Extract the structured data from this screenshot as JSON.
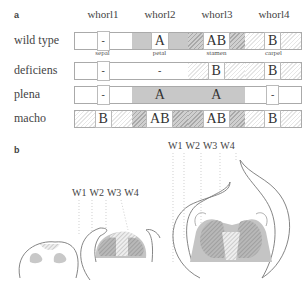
{
  "panel_a": {
    "label": "a",
    "whorls": [
      "whorl1",
      "whorl2",
      "whorl3",
      "whorl4"
    ],
    "organs": [
      "sepal",
      "petal",
      "stamen",
      "carpel"
    ],
    "rows": [
      {
        "name": "wild type",
        "cells": [
          {
            "value": "-",
            "shade": "none"
          },
          {
            "value": "A",
            "shade": "A"
          },
          {
            "value": "AB",
            "shade": "AB"
          },
          {
            "value": "B",
            "shade": "B"
          }
        ]
      },
      {
        "name": "deficiens",
        "cells": [
          {
            "value": "-",
            "shade": "none"
          },
          {
            "value": "-",
            "shade": "none"
          },
          {
            "value": "B",
            "shade": "B"
          },
          {
            "value": "B",
            "shade": "B"
          }
        ]
      },
      {
        "name": "plena",
        "cells": [
          {
            "value": "-",
            "shade": "none"
          },
          {
            "value": "A",
            "shade": "A"
          },
          {
            "value": "A",
            "shade": "A"
          },
          {
            "value": "-",
            "shade": "none"
          }
        ]
      },
      {
        "name": "macho",
        "cells": [
          {
            "value": "B",
            "shade": "B"
          },
          {
            "value": "AB",
            "shade": "AB"
          },
          {
            "value": "AB",
            "shade": "AB"
          },
          {
            "value": "B",
            "shade": "B"
          }
        ]
      }
    ],
    "colors": {
      "A": "#c8c8c8",
      "B_hatch": "#e6e6e6",
      "AB": "#a8a8a8",
      "border": "#aaaaaa"
    }
  },
  "panel_b": {
    "label": "b",
    "whorl_labels_mid": [
      "W1",
      "W2",
      "W3",
      "W4"
    ],
    "whorl_labels_large": [
      "W1",
      "W2",
      "W3",
      "W4"
    ],
    "stages": [
      "early floral bud",
      "intermediate floral bud",
      "late floral bud"
    ]
  }
}
